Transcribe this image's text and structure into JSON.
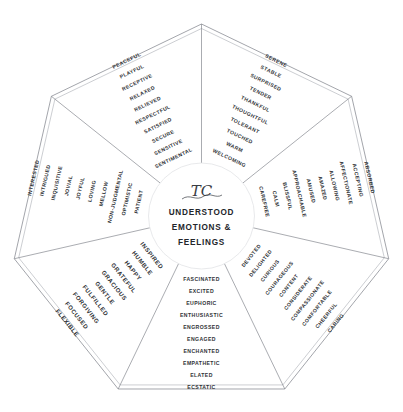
{
  "center": {
    "logo_glyph": "TC",
    "line1": "UNDERSTOOD",
    "line2": "EMOTIONS &",
    "line3": "FEELINGS"
  },
  "colors": {
    "line": "#6e7179",
    "outer_line": "#8b8e95",
    "text": "#2f3236",
    "center_text": "#23262b",
    "background": "#ffffff"
  },
  "chart_data": {
    "type": "pie",
    "shape": "heptagon",
    "segment_count": 7,
    "words_per_segment": 10,
    "legend_position": "none",
    "segments": [
      {
        "index": 0,
        "position": "top-left",
        "angle_deg": -77.14,
        "words": [
          "SERENE",
          "STABLE",
          "SURPRISED",
          "TENDER",
          "THANKFUL",
          "THOUGHTFUL",
          "TOLERANT",
          "TOUCHED",
          "WARM",
          "WELCOMING"
        ]
      },
      {
        "index": 1,
        "position": "top-right",
        "angle_deg": -25.71,
        "words": [
          "ABSORBED",
          "ACCEPTING",
          "AFFECTIONATE",
          "ALLOWING",
          "AMAZED",
          "AMUSED",
          "APPROACHABLE",
          "BLISSFUL",
          "CALM",
          "CAREFREE"
        ]
      },
      {
        "index": 2,
        "position": "right",
        "angle_deg": 25.71,
        "words": [
          "CARING",
          "CHEERFUL",
          "COMFORTABLE",
          "COMPASSIONATE",
          "CONSIDERATE",
          "CONTENT",
          "COURAGEOUS",
          "CURIOUS",
          "DELIGHTED",
          "DEVOTED"
        ]
      },
      {
        "index": 3,
        "position": "bottom-right",
        "angle_deg": 77.14,
        "words": [
          "ECSTATIC",
          "ELATED",
          "EMPATHETIC",
          "ENCHANTED",
          "ENGAGED",
          "ENGROSSED",
          "ENTHUSIASTIC",
          "EUPHORIC",
          "EXCITED",
          "FASCINATED"
        ]
      },
      {
        "index": 4,
        "position": "bottom",
        "angle_deg": 128.57,
        "words": [
          "FLEXIBLE",
          "FOCUSED",
          "FORGIVING",
          "FULFILLED",
          "GENTLE",
          "GRACIOUS",
          "GRATEFUL",
          "HAPPY",
          "HUMBLE",
          "INSPIRED"
        ]
      },
      {
        "index": 5,
        "position": "bottom-left",
        "angle_deg": 180,
        "words": [
          "INTERESTED",
          "INTRIGUED",
          "INQUISITIVE",
          "JOVIAL",
          "JOYFUL",
          "LOVING",
          "MELLOW",
          "NON-JUDGMENTAL",
          "OPTIMISTIC",
          "PATIENT"
        ]
      },
      {
        "index": 6,
        "position": "left",
        "angle_deg": 231.43,
        "words": [
          "PEACEFUL",
          "PLAYFUL",
          "RECEPTIVE",
          "RELAXED",
          "RELIEVED",
          "RESPECTFUL",
          "SATISFIED",
          "SECURE",
          "SENSITIVE",
          "SENTIMENTAL"
        ]
      }
    ]
  }
}
